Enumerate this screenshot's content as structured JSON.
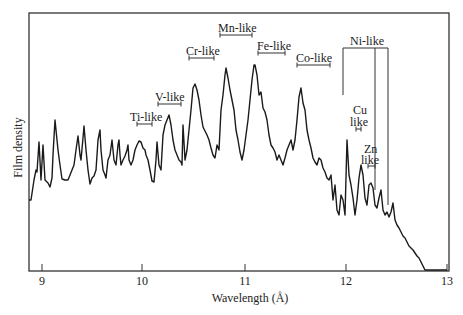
{
  "chart_data": {
    "type": "line",
    "title": "",
    "xlabel": "Wavelength (Å)",
    "ylabel": "Film density",
    "xlim": [
      8.87,
      13.0
    ],
    "ylim": [
      0,
      1
    ],
    "grid": false,
    "legend": null,
    "x_ticks": [
      9,
      10,
      11,
      12,
      13
    ],
    "y_ticks": [],
    "series": [
      {
        "name": "Film density spectrum",
        "color": "#1a1a1a",
        "units": "arbitrary",
        "points_px": [
          [
            29,
            200
          ],
          [
            31,
            200
          ],
          [
            34,
            180
          ],
          [
            36,
            170
          ],
          [
            37,
            172
          ],
          [
            39,
            142
          ],
          [
            41,
            180
          ],
          [
            43,
            145
          ],
          [
            45,
            180
          ],
          [
            48,
            183
          ],
          [
            50,
            187
          ],
          [
            52,
            178
          ],
          [
            53,
            155
          ],
          [
            55,
            120
          ],
          [
            57,
            140
          ],
          [
            58,
            150
          ],
          [
            60,
            165
          ],
          [
            62,
            179
          ],
          [
            65,
            180
          ],
          [
            68,
            180
          ],
          [
            70,
            175
          ],
          [
            72,
            170
          ],
          [
            74,
            165
          ],
          [
            76,
            150
          ],
          [
            78,
            136
          ],
          [
            80,
            155
          ],
          [
            81,
            160
          ],
          [
            83,
            138
          ],
          [
            84,
            126
          ],
          [
            86,
            150
          ],
          [
            88,
            170
          ],
          [
            90,
            184
          ],
          [
            92,
            178
          ],
          [
            94,
            176
          ],
          [
            96,
            170
          ],
          [
            98,
            140
          ],
          [
            100,
            130
          ],
          [
            101,
            150
          ],
          [
            103,
            170
          ],
          [
            105,
            175
          ],
          [
            106,
            178
          ],
          [
            108,
            160
          ],
          [
            110,
            155
          ],
          [
            112,
            140
          ],
          [
            114,
            160
          ],
          [
            116,
            165
          ],
          [
            118,
            145
          ],
          [
            119,
            140
          ],
          [
            120,
            155
          ],
          [
            121,
            165
          ],
          [
            123,
            160
          ],
          [
            125,
            156
          ],
          [
            127,
            150
          ],
          [
            128,
            145
          ],
          [
            129,
            160
          ],
          [
            131,
            165
          ],
          [
            133,
            160
          ],
          [
            135,
            150
          ],
          [
            137,
            145
          ],
          [
            139,
            141
          ],
          [
            141,
            142
          ],
          [
            143,
            148
          ],
          [
            145,
            150
          ],
          [
            146,
            155
          ],
          [
            148,
            160
          ],
          [
            150,
            170
          ],
          [
            152,
            181
          ],
          [
            154,
            182
          ],
          [
            156,
            160
          ],
          [
            157,
            142
          ],
          [
            159,
            165
          ],
          [
            161,
            170
          ],
          [
            163,
            135
          ],
          [
            165,
            125
          ],
          [
            167,
            120
          ],
          [
            169,
            115
          ],
          [
            171,
            125
          ],
          [
            173,
            140
          ],
          [
            175,
            150
          ],
          [
            177,
            155
          ],
          [
            179,
            160
          ],
          [
            181,
            162
          ],
          [
            182,
            165
          ],
          [
            183,
            125
          ],
          [
            185,
            160
          ],
          [
            187,
            150
          ],
          [
            189,
            130
          ],
          [
            191,
            110
          ],
          [
            193,
            88
          ],
          [
            195,
            84
          ],
          [
            197,
            90
          ],
          [
            199,
            100
          ],
          [
            201,
            115
          ],
          [
            203,
            127
          ],
          [
            205,
            131
          ],
          [
            207,
            135
          ],
          [
            209,
            140
          ],
          [
            211,
            148
          ],
          [
            213,
            155
          ],
          [
            215,
            158
          ],
          [
            217,
            145
          ],
          [
            219,
            150
          ],
          [
            221,
            110
          ],
          [
            223,
            95
          ],
          [
            225,
            75
          ],
          [
            226,
            68
          ],
          [
            228,
            78
          ],
          [
            230,
            90
          ],
          [
            232,
            100
          ],
          [
            234,
            110
          ],
          [
            236,
            130
          ],
          [
            238,
            140
          ],
          [
            240,
            152
          ],
          [
            242,
            160
          ],
          [
            244,
            150
          ],
          [
            246,
            135
          ],
          [
            248,
            120
          ],
          [
            250,
            100
          ],
          [
            252,
            80
          ],
          [
            254,
            65
          ],
          [
            255,
            65
          ],
          [
            257,
            75
          ],
          [
            259,
            95
          ],
          [
            261,
            92
          ],
          [
            263,
            108
          ],
          [
            265,
            112
          ],
          [
            267,
            120
          ],
          [
            269,
            135
          ],
          [
            271,
            145
          ],
          [
            273,
            148
          ],
          [
            275,
            152
          ],
          [
            277,
            160
          ],
          [
            279,
            155
          ],
          [
            281,
            160
          ],
          [
            283,
            165
          ],
          [
            285,
            158
          ],
          [
            287,
            150
          ],
          [
            289,
            145
          ],
          [
            291,
            140
          ],
          [
            293,
            150
          ],
          [
            295,
            140
          ],
          [
            297,
            120
          ],
          [
            299,
            97
          ],
          [
            301,
            88
          ],
          [
            303,
            103
          ],
          [
            305,
            110
          ],
          [
            307,
            130
          ],
          [
            309,
            140
          ],
          [
            311,
            148
          ],
          [
            313,
            158
          ],
          [
            315,
            162
          ],
          [
            317,
            165
          ],
          [
            319,
            158
          ],
          [
            321,
            160
          ],
          [
            323,
            168
          ],
          [
            325,
            172
          ],
          [
            327,
            178
          ],
          [
            329,
            180
          ],
          [
            331,
            175
          ],
          [
            333,
            200
          ],
          [
            335,
            185
          ],
          [
            337,
            210
          ],
          [
            339,
            215
          ],
          [
            341,
            195
          ],
          [
            343,
            200
          ],
          [
            345,
            215
          ],
          [
            347,
            140
          ],
          [
            349,
            175
          ],
          [
            351,
            185
          ],
          [
            353,
            198
          ],
          [
            355,
            215
          ],
          [
            357,
            200
          ],
          [
            359,
            178
          ],
          [
            361,
            165
          ],
          [
            363,
            175
          ],
          [
            365,
            198
          ],
          [
            367,
            205
          ],
          [
            369,
            185
          ],
          [
            371,
            183
          ],
          [
            373,
            188
          ],
          [
            375,
            205
          ],
          [
            377,
            208
          ],
          [
            379,
            198
          ],
          [
            381,
            190
          ],
          [
            383,
            210
          ],
          [
            385,
            215
          ],
          [
            387,
            212
          ],
          [
            389,
            217
          ],
          [
            391,
            212
          ],
          [
            393,
            203
          ],
          [
            395,
            220
          ],
          [
            397,
            225
          ],
          [
            399,
            228
          ],
          [
            401,
            232
          ],
          [
            403,
            236
          ],
          [
            405,
            238
          ],
          [
            407,
            242
          ],
          [
            409,
            246
          ],
          [
            411,
            248
          ],
          [
            413,
            250
          ],
          [
            415,
            253
          ],
          [
            417,
            256
          ],
          [
            419,
            258
          ],
          [
            421,
            262
          ],
          [
            423,
            266
          ],
          [
            425,
            270
          ],
          [
            429,
            270
          ],
          [
            433,
            270
          ],
          [
            437,
            270
          ],
          [
            441,
            270
          ],
          [
            447,
            270
          ]
        ]
      }
    ],
    "annotations": [
      {
        "label": "Ti-like",
        "range": [
          9.98,
          10.06
        ],
        "bar_px": {
          "x1": 137,
          "x2": 152,
          "y": 124
        },
        "text_px": {
          "x": 131,
          "y": 110
        }
      },
      {
        "label": "V-like",
        "range": [
          10.17,
          10.39
        ],
        "bar_px": {
          "x1": 158,
          "x2": 181,
          "y": 104
        },
        "text_px": {
          "x": 155,
          "y": 90
        }
      },
      {
        "label": "Cr-like",
        "range": [
          10.47,
          10.72
        ],
        "bar_px": {
          "x1": 189,
          "x2": 214,
          "y": 58
        },
        "text_px": {
          "x": 186,
          "y": 44
        }
      },
      {
        "label": "Mn-like",
        "range": [
          10.85,
          11.05
        ],
        "bar_px": {
          "x1": 220,
          "x2": 252,
          "y": 35
        },
        "text_px": {
          "x": 218,
          "y": 21
        }
      },
      {
        "label": "Fe-like",
        "range": [
          11.13,
          11.4
        ],
        "bar_px": {
          "x1": 258,
          "x2": 285,
          "y": 53
        },
        "text_px": {
          "x": 257,
          "y": 39
        }
      },
      {
        "label": "Co-like",
        "range": [
          11.53,
          11.86
        ],
        "bar_px": {
          "x1": 297,
          "x2": 330,
          "y": 65
        },
        "text_px": {
          "x": 296,
          "y": 51
        }
      },
      {
        "label": "Ni-like",
        "bracket_px": {
          "x1": 343,
          "x2": 388,
          "x_mid": 375,
          "y": 48,
          "y_bottom_left": 95,
          "y_bottom_mid": 190,
          "y_bottom_right": 205
        },
        "text_px": {
          "x": 350,
          "y": 34
        }
      },
      {
        "label_lines": [
          "Cu",
          "like"
        ],
        "bar_px": {
          "x1": 356,
          "x2": 361,
          "y": 129
        },
        "text_px": {
          "x": 352,
          "y": 104
        }
      },
      {
        "label_lines": [
          "Zn",
          "like"
        ],
        "bar_px": {
          "x1": 368,
          "x2": 375,
          "y": 166
        },
        "text_px": {
          "x": 362,
          "y": 142
        }
      }
    ]
  },
  "frame_px": {
    "left": 29,
    "top": 13,
    "right": 449,
    "bottom": 271
  },
  "x_ticks_px": [
    {
      "label": "9",
      "x": 42
    },
    {
      "label": "10",
      "x": 142
    },
    {
      "label": "11",
      "x": 245
    },
    {
      "label": "12",
      "x": 346
    },
    {
      "label": "13",
      "x": 447
    }
  ],
  "labels": {
    "xlabel": "Wavelength (Å)",
    "ylabel": "Film density",
    "ti": "Ti-like",
    "v": "V-like",
    "cr": "Cr-like",
    "mn": "Mn-like",
    "fe": "Fe-like",
    "co": "Co-like",
    "ni": "Ni-like",
    "cu1": "Cu",
    "cu2": "like",
    "zn1": "Zn",
    "zn2": "like"
  }
}
